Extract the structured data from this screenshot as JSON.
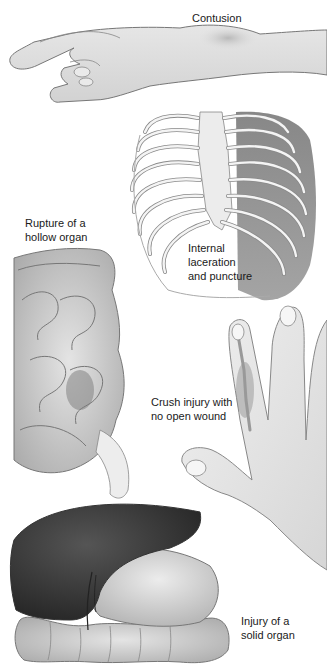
{
  "figure": {
    "labels": {
      "contusion": {
        "lines": [
          "Contusion"
        ]
      },
      "hollow_organ": {
        "lines": [
          "Rupture of a",
          "hollow organ"
        ]
      },
      "internal_laceration": {
        "lines": [
          "Internal",
          "laceration",
          "and puncture"
        ]
      },
      "crush_injury": {
        "lines": [
          "Crush injury with",
          "no open wound"
        ]
      },
      "solid_organ": {
        "lines": [
          "Injury of a",
          "solid organ"
        ]
      }
    },
    "illustrations": [
      {
        "name": "arm-with-contusion",
        "caption": "Contusion"
      },
      {
        "name": "rib-cage-with-lung",
        "caption": "Internal laceration and puncture"
      },
      {
        "name": "intestines",
        "caption": "Rupture of a hollow organ"
      },
      {
        "name": "hand-with-crushed-finger",
        "caption": "Crush injury with no open wound"
      },
      {
        "name": "liver-and-colon",
        "caption": "Injury of a solid organ"
      }
    ],
    "colors": {
      "background": "#ffffff",
      "line": "#6e6e6e",
      "skin": "#e2e2e2",
      "bone": "#f0f0f0",
      "lung": "#8a8a8a",
      "liver": "#3a3a3a",
      "stomach": "#d0d0d0"
    }
  }
}
